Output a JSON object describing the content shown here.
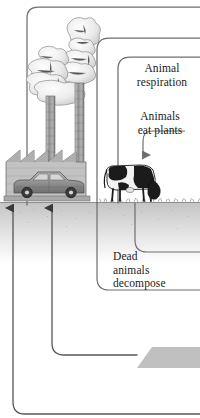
{
  "figure": {
    "type": "diagram",
    "width": 200,
    "height": 418,
    "background_color": "#ffffff"
  },
  "labels": {
    "animal_respiration": "Animal\nrespiration",
    "animals_eat_plants": "Animals\neat plants",
    "dead_animals_decompose": "Dead\nanimals\ndecompose"
  },
  "colors": {
    "line": "#6e6e6e",
    "line_dark": "#555555",
    "text": "#1a1a1a",
    "ground": "#c9c9c9",
    "ground_line": "#8a8a8a",
    "deposit": "#c0c0c0",
    "smoke": "#e8e8e8",
    "smoke_outline": "#8d8d8d",
    "stack": "#9a9a9a",
    "factory": "#bdbdbd",
    "car_body": "#8f8f8f",
    "cow_black": "#1b1b1b",
    "cow_white": "#f2f2f2"
  },
  "scene_objects": [
    {
      "name": "factory",
      "label": "factory with sawtooth roof",
      "roof_peaks": 3
    },
    {
      "name": "smokestack-left",
      "label": "smokestack emitting smoke"
    },
    {
      "name": "smokestack-right",
      "label": "smokestack emitting smoke"
    },
    {
      "name": "car",
      "label": "car emitting exhaust"
    },
    {
      "name": "cow",
      "label": "grazing cow"
    },
    {
      "name": "fossil-fuel-deposit",
      "label": "underground fossil fuel deposit"
    },
    {
      "name": "ground",
      "label": "ground surface with grass"
    }
  ],
  "flow_arrows": [
    {
      "name": "arrow-into-factory-left",
      "direction": "up",
      "target": "factory"
    },
    {
      "name": "arrow-into-car",
      "direction": "up",
      "target": "car"
    },
    {
      "name": "arrow-to-cow",
      "direction": "down",
      "target": "cow",
      "from": "animals_eat_plants"
    }
  ]
}
